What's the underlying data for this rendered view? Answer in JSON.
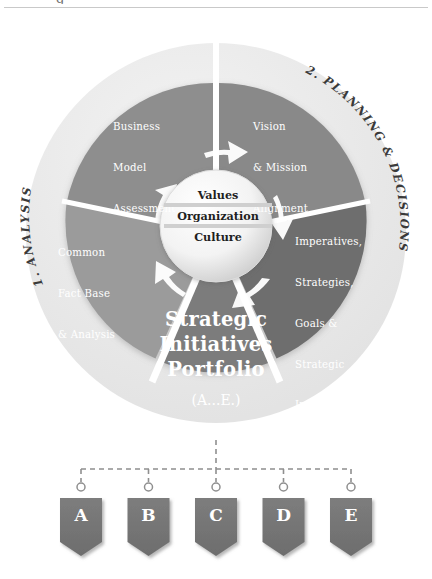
{
  "diagram": {
    "title_clipped_top": "g",
    "colors": {
      "outer_ring": "#e9e9e9",
      "sector_top_left": "#8e8e8e",
      "sector_top_right": "#8a8a8a",
      "sector_bottom_left": "#9a9a9a",
      "sector_bottom_right": "#6e6e6e",
      "sector_bottom": "#7a7a7a",
      "hub_fill": "#f2f2f2",
      "pennant": "#767676",
      "arc_label": "#3b3b3b",
      "connector": "#9a9a9a"
    },
    "arc_labels": [
      {
        "name": "phase-1",
        "text": "1. ANALYSIS"
      },
      {
        "name": "phase-2",
        "text": "2. PLANNING & DECISIONS"
      }
    ],
    "sectors": [
      {
        "name": "business-model-assessment",
        "position": "top-left",
        "lines": [
          "Business",
          "Model",
          "Assessment"
        ]
      },
      {
        "name": "vision-mission-alignment",
        "position": "top-right",
        "lines": [
          "Vision",
          "& Mission",
          "Alignment"
        ]
      },
      {
        "name": "common-fact-base",
        "position": "bottom-left",
        "lines": [
          "Common",
          "Fact Base",
          "& Analysis"
        ]
      },
      {
        "name": "imperatives-strategies",
        "position": "bottom-right",
        "lines": [
          "Imperatives,",
          "Strategies,",
          "Goals &",
          "Strategic",
          "Initiatives"
        ]
      }
    ],
    "hub": {
      "name": "core-hub",
      "lines": [
        "Values",
        "Organization",
        "Culture"
      ]
    },
    "portfolio": {
      "name": "strategic-initiatives-portfolio",
      "lines": [
        "Strategic",
        "Initiatives",
        "Portfolio"
      ],
      "subtitle": "(A...E.)"
    },
    "pennants": [
      {
        "name": "pennant-a",
        "label": "A"
      },
      {
        "name": "pennant-b",
        "label": "B"
      },
      {
        "name": "pennant-c",
        "label": "C"
      },
      {
        "name": "pennant-d",
        "label": "D"
      },
      {
        "name": "pennant-e",
        "label": "E"
      }
    ]
  }
}
